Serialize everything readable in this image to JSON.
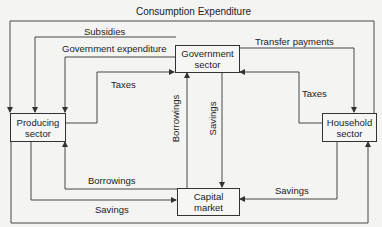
{
  "title": "Consumption Expenditure",
  "nodes": {
    "producing": {
      "line1": "Producing",
      "line2": "sector"
    },
    "government": {
      "line1": "Government",
      "line2": "sector"
    },
    "household": {
      "line1": "Household",
      "line2": "sector"
    },
    "capital": {
      "line1": "Capital",
      "line2": "market"
    }
  },
  "flows": {
    "consumption": "Consumption Expenditure",
    "subsidies": "Subsidies",
    "gov_expenditure": "Government expenditure",
    "taxes_producing": "Taxes",
    "transfer_payments": "Transfer payments",
    "taxes_household": "Taxes",
    "borrowings_gov": "Borrowings",
    "savings_gov": "Savings",
    "borrowings_producing": "Borrowings",
    "savings_producing": "Savings",
    "savings_household": "Savings"
  },
  "colors": {
    "line": "#333333",
    "background": "#f4f4f2"
  }
}
